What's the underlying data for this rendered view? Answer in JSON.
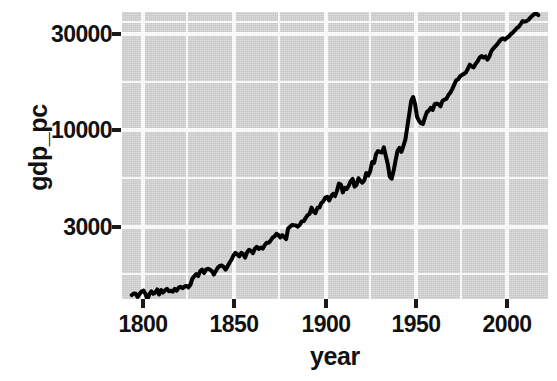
{
  "chart_data": {
    "type": "line",
    "title": "",
    "xlabel": "year",
    "ylabel": "gdp_pc",
    "xlim": [
      1795,
      2013
    ],
    "ylim": [
      1270,
      36500
    ],
    "yscale": "log10",
    "xticks": [
      1800,
      1850,
      1900,
      1950,
      2000
    ],
    "xtick_labels": [
      "1800",
      "1850",
      "1900",
      "1950",
      "2000"
    ],
    "yticks": [
      3000,
      10000,
      30000
    ],
    "ytick_labels": [
      "3000",
      "10000",
      "30000"
    ],
    "grid": true,
    "grid_color": "#ffffff",
    "panel_color": "#d3d3d3",
    "line_color": "#000000",
    "line_width": 4,
    "legend": "none",
    "x": [
      1800,
      1801,
      1802,
      1803,
      1804,
      1805,
      1806,
      1807,
      1808,
      1809,
      1810,
      1811,
      1812,
      1813,
      1814,
      1815,
      1816,
      1817,
      1818,
      1819,
      1820,
      1821,
      1822,
      1823,
      1824,
      1825,
      1826,
      1827,
      1828,
      1829,
      1830,
      1831,
      1832,
      1833,
      1834,
      1835,
      1836,
      1837,
      1838,
      1839,
      1840,
      1841,
      1842,
      1843,
      1844,
      1845,
      1846,
      1847,
      1848,
      1849,
      1850,
      1851,
      1852,
      1853,
      1854,
      1855,
      1856,
      1857,
      1858,
      1859,
      1860,
      1861,
      1862,
      1863,
      1864,
      1865,
      1866,
      1867,
      1868,
      1869,
      1870,
      1871,
      1872,
      1873,
      1874,
      1875,
      1876,
      1877,
      1878,
      1879,
      1880,
      1881,
      1882,
      1883,
      1884,
      1885,
      1886,
      1887,
      1888,
      1889,
      1890,
      1891,
      1892,
      1893,
      1894,
      1895,
      1896,
      1897,
      1898,
      1899,
      1900,
      1901,
      1902,
      1903,
      1904,
      1905,
      1906,
      1907,
      1908,
      1909,
      1910,
      1911,
      1912,
      1913,
      1914,
      1915,
      1916,
      1917,
      1918,
      1919,
      1920,
      1921,
      1922,
      1923,
      1924,
      1925,
      1926,
      1927,
      1928,
      1929,
      1930,
      1931,
      1932,
      1933,
      1934,
      1935,
      1936,
      1937,
      1938,
      1939,
      1940,
      1941,
      1942,
      1943,
      1944,
      1945,
      1946,
      1947,
      1948,
      1949,
      1950,
      1951,
      1952,
      1953,
      1954,
      1955,
      1956,
      1957,
      1958,
      1959,
      1960,
      1961,
      1962,
      1963,
      1964,
      1965,
      1966,
      1967,
      1968,
      1969,
      1970,
      1971,
      1972,
      1973,
      1974,
      1975,
      1976,
      1977,
      1978,
      1979,
      1980,
      1981,
      1982,
      1983,
      1984,
      1985,
      1986,
      1987,
      1988,
      1989,
      1990,
      1991,
      1992,
      1993,
      1994,
      1995,
      1996,
      1997,
      1998,
      1999,
      2000,
      2001,
      2002,
      2003,
      2004,
      2005,
      2006,
      2007,
      2008
    ],
    "y": [
      1330,
      1355,
      1350,
      1300,
      1345,
      1385,
      1400,
      1350,
      1260,
      1345,
      1390,
      1350,
      1370,
      1420,
      1340,
      1410,
      1370,
      1405,
      1430,
      1390,
      1400,
      1385,
      1430,
      1400,
      1450,
      1465,
      1440,
      1470,
      1480,
      1455,
      1500,
      1610,
      1660,
      1700,
      1660,
      1760,
      1790,
      1720,
      1790,
      1810,
      1790,
      1760,
      1690,
      1760,
      1830,
      1870,
      1880,
      1850,
      1790,
      1860,
      1940,
      2010,
      2110,
      2180,
      2140,
      2090,
      2180,
      2150,
      2060,
      2190,
      2260,
      2230,
      2170,
      2290,
      2340,
      2280,
      2320,
      2290,
      2380,
      2450,
      2450,
      2510,
      2600,
      2640,
      2720,
      2690,
      2610,
      2680,
      2620,
      2560,
      2900,
      2960,
      3020,
      3010,
      3000,
      2960,
      3030,
      3150,
      3160,
      3280,
      3390,
      3440,
      3700,
      3530,
      3470,
      3690,
      3700,
      3900,
      3980,
      4150,
      4200,
      4020,
      4220,
      4340,
      4230,
      4500,
      4900,
      4850,
      4420,
      4660,
      4600,
      4780,
      5030,
      5180,
      4730,
      4820,
      5220,
      5060,
      4950,
      5100,
      5550,
      5380,
      5650,
      6310,
      6240,
      6920,
      7180,
      7100,
      7050,
      7490,
      6770,
      6170,
      5320,
      5190,
      5690,
      6430,
      7190,
      7440,
      7110,
      7620,
      8200,
      9500,
      11100,
      12900,
      13500,
      12400,
      10700,
      10200,
      9950,
      9850,
      10600,
      11300,
      11500,
      11900,
      11600,
      12400,
      12500,
      12400,
      12100,
      12900,
      13100,
      13200,
      13800,
      14200,
      14800,
      15600,
      16400,
      16600,
      17200,
      17500,
      17700,
      18000,
      18800,
      19700,
      19300,
      19100,
      19900,
      20500,
      21400,
      21800,
      21400,
      21700,
      20900,
      21700,
      23100,
      23800,
      24400,
      25000,
      25800,
      26500,
      26800,
      26400,
      27000,
      27400,
      28200,
      28700,
      29400,
      30200,
      30700,
      31700,
      32800,
      32600,
      32800,
      33300,
      34200,
      35000,
      35600,
      35900,
      35200
    ]
  },
  "axes": {
    "ylabel": "gdp_pc",
    "xlabel": "year",
    "ytick_labels": [
      "30000",
      "10000",
      "3000"
    ],
    "xtick_labels": [
      "1800",
      "1850",
      "1900",
      "1950",
      "2000"
    ]
  }
}
